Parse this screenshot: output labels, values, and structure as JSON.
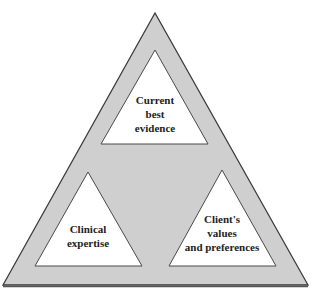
{
  "diagram": {
    "type": "nested-triangle",
    "colors": {
      "outer_fill": "#cfcfcf",
      "outer_stroke": "#3a3a3a",
      "inner_fill": "#ffffff",
      "text": "#222222"
    },
    "components": [
      {
        "id": "evidence",
        "lines": [
          "Current",
          "best",
          "evidence"
        ]
      },
      {
        "id": "expertise",
        "lines": [
          "Clinical",
          "expertise"
        ]
      },
      {
        "id": "values",
        "lines": [
          "Client's",
          "values",
          "and preferences"
        ]
      }
    ]
  }
}
